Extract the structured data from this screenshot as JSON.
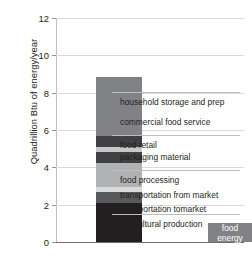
{
  "chart_data": {
    "type": "bar",
    "title": "",
    "subtitle": "",
    "xlabel": "",
    "ylabel": "Quadrillion Btu of energy/year",
    "ylim": [
      0,
      12
    ],
    "yticks": [
      0,
      2,
      4,
      6,
      8,
      10,
      12
    ],
    "ytick_labels": [
      "0",
      "2",
      "4",
      "6",
      "8",
      "10",
      "12"
    ],
    "grid": true,
    "legend_position": "right-callout",
    "categories": [
      "food system energy use",
      "food energy"
    ],
    "stacked": true,
    "series": [
      {
        "name": "agricultural production",
        "values": [
          2.1,
          0
        ],
        "color": "#231f20"
      },
      {
        "name": "transportation to market",
        "values": [
          0.6,
          0
        ],
        "color": "#58595b"
      },
      {
        "name": "transportation from market",
        "values": [
          0.25,
          0
        ],
        "color": "#d9dadb"
      },
      {
        "name": "food processing",
        "values": [
          1.3,
          0
        ],
        "color": "#b0b2b4"
      },
      {
        "name": "packaging material",
        "values": [
          0.55,
          0
        ],
        "color": "#414042"
      },
      {
        "name": "food retail",
        "values": [
          0.3,
          0
        ],
        "color": "#c7c8ca"
      },
      {
        "name": "commercial food service",
        "values": [
          0.6,
          0
        ],
        "color": "#414042"
      },
      {
        "name": "household storage and prep",
        "values": [
          3.15,
          0
        ],
        "color": "#808285"
      },
      {
        "name": "food energy",
        "values": [
          0,
          1.0
        ],
        "color": "#808285"
      }
    ],
    "bar_totals": [
      8.85,
      1.0
    ],
    "stacked_bar_top_value": 9.9,
    "food_energy_bar_value": 1.0,
    "annotations": [
      {
        "text": "food energy",
        "target": "food-energy-bar"
      }
    ]
  },
  "axis": {
    "y_title": "Quadrillion Btu of energy/year",
    "ticks": [
      {
        "label": "12",
        "value": 12
      },
      {
        "label": "10",
        "value": 10
      },
      {
        "label": "8",
        "value": 8
      },
      {
        "label": "6",
        "value": 6
      },
      {
        "label": "4",
        "value": 4
      },
      {
        "label": "2",
        "value": 2
      },
      {
        "label": "0",
        "value": 0
      }
    ]
  },
  "legend": {
    "items": [
      {
        "label": "household storage and prep"
      },
      {
        "label": "commercial food service"
      },
      {
        "label": "food retail"
      },
      {
        "label": "packaging material"
      },
      {
        "label": "food processing"
      },
      {
        "label": "transportation from market"
      },
      {
        "label": "transportation tomarket"
      },
      {
        "label": "agricultural production"
      }
    ]
  },
  "bars": {
    "food_energy": {
      "label_line1": "food",
      "label_line2": "energy"
    }
  }
}
